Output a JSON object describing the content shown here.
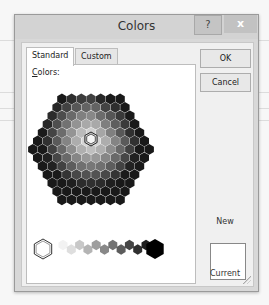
{
  "dialog": {
    "title": "Colors",
    "help_label": "?",
    "close_label": "x"
  },
  "tabs": [
    {
      "label": "Standard",
      "active": true
    },
    {
      "label": "Custom",
      "active": false
    }
  ],
  "panel": {
    "colors_label_accel": "C",
    "colors_label_rest": "olors:"
  },
  "buttons": {
    "ok": "OK",
    "cancel": "Cancel"
  },
  "preview": {
    "new_label": "New",
    "current_label": "Current",
    "new_color": "#ffffff"
  },
  "grayscale_row": [
    "#ffffff",
    "#f2f2f2",
    "#dedede",
    "#c8c8c8",
    "#b4b4b4",
    "#9e9e9e",
    "#888888",
    "#727272",
    "#5c5c5c",
    "#464646",
    "#303030",
    "#1e1e1e",
    "#000000"
  ],
  "selected": {
    "row": 6,
    "col": 5
  }
}
